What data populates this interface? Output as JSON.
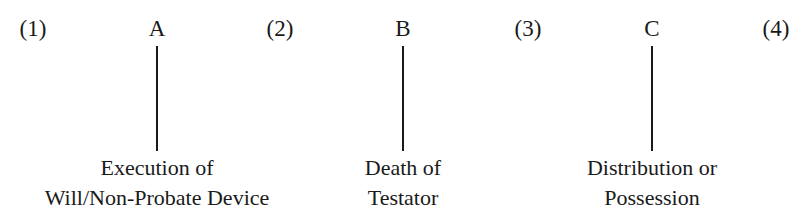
{
  "diagram": {
    "type": "timeline",
    "periods": [
      {
        "label": "(1)",
        "x": 33
      },
      {
        "label": "(2)",
        "x": 280
      },
      {
        "label": "(3)",
        "x": 528
      },
      {
        "label": "(4)",
        "x": 776
      }
    ],
    "events": [
      {
        "letter": "A",
        "x": 157,
        "caption_lines": [
          "Execution of",
          "Will/Non-Probate Device"
        ]
      },
      {
        "letter": "B",
        "x": 403,
        "caption_lines": [
          "Death of",
          "Testator"
        ]
      },
      {
        "letter": "C",
        "x": 652,
        "caption_lines": [
          "Distribution or",
          "Possession"
        ]
      }
    ]
  }
}
